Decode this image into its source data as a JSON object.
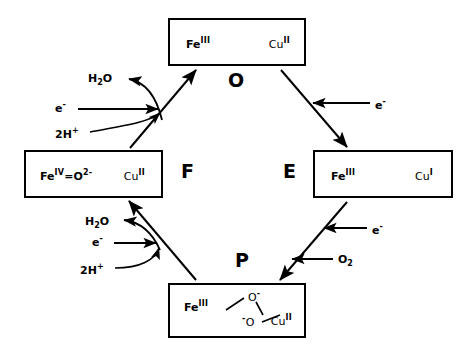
{
  "diagram": {
    "cycle_direction": "counterclockwise",
    "ink_color": "#000000",
    "background_color": "#ffffff"
  },
  "states": {
    "O": {
      "letter": "O",
      "position": "top",
      "fe": "Fe",
      "fe_oxidation": "III",
      "cu": "Cu",
      "cu_oxidation": "II"
    },
    "F": {
      "letter": "F",
      "position": "left",
      "fe": "Fe",
      "fe_oxidation": "IV",
      "fe_ligand": "=O",
      "fe_ligand_charge": "2-",
      "cu": "Cu",
      "cu_oxidation": "II"
    },
    "E": {
      "letter": "E",
      "position": "right",
      "fe": "Fe",
      "fe_oxidation": "III",
      "cu": "Cu",
      "cu_oxidation": "I"
    },
    "P": {
      "letter": "P",
      "position": "bottom",
      "fe": "Fe",
      "fe_oxidation": "III",
      "cu": "Cu",
      "cu_oxidation": "II",
      "bridge_o_upper": "O",
      "bridge_o_upper_charge": "-",
      "bridge_o_lower": "O",
      "bridge_o_lower_charge": "-"
    }
  },
  "edges": [
    {
      "name": "F-to-O",
      "from": "F",
      "to": "O",
      "arrowhead": "at-O"
    },
    {
      "name": "O-to-E",
      "from": "O",
      "to": "E",
      "arrowhead": "at-E"
    },
    {
      "name": "E-to-P",
      "from": "E",
      "to": "P",
      "arrowhead": "at-P"
    },
    {
      "name": "P-to-F",
      "from": "P",
      "to": "F",
      "arrowhead": "at-F"
    }
  ],
  "reagents": {
    "upper_left": {
      "water_out": "H",
      "water_out_sub": "2",
      "water_out_tail": "O",
      "electron_in": "e",
      "electron_charge": "-",
      "protons_in": "2H",
      "protons_charge": "+"
    },
    "upper_right": {
      "electron_in": "e",
      "electron_charge": "-"
    },
    "lower_left": {
      "water_out": "H",
      "water_out_sub": "2",
      "water_out_tail": "O",
      "electron_in": "e",
      "electron_charge": "-",
      "protons_in": "2H",
      "protons_charge": "+"
    },
    "lower_right": {
      "electron_in": "e",
      "electron_charge": "-",
      "dioxygen_in": "O",
      "dioxygen_sub": "2"
    }
  }
}
